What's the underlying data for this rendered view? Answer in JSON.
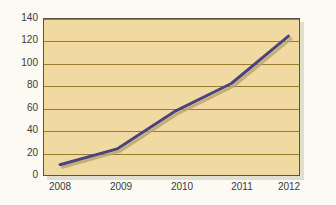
{
  "chart_data": {
    "type": "line",
    "title": "",
    "subtitle": "",
    "xlabel": "",
    "ylabel": "",
    "categories": [
      "2008",
      "2009",
      "2010",
      "2011",
      "2012"
    ],
    "x": [
      2008,
      2009,
      2010,
      2011,
      2012
    ],
    "series": [
      {
        "name": "",
        "values": [
          10,
          24,
          57,
          82,
          124
        ],
        "color": "#4a4480"
      }
    ],
    "values": [
      10,
      24,
      57,
      82,
      124
    ],
    "ylim": [
      0,
      140
    ],
    "yticks": [
      0,
      20,
      40,
      60,
      80,
      100,
      120,
      140
    ],
    "ytick_labels": [
      "0",
      "20",
      "40",
      "60",
      "80",
      "100",
      "120",
      "140"
    ],
    "xtick_labels": [
      "2008",
      "2009",
      "2010",
      "2011",
      "2012"
    ],
    "grid": true,
    "grid_axis": "y",
    "legend": false,
    "legend_position": "none",
    "annotations": [],
    "colors": {
      "plot_background": "#f1d9a2",
      "gridline": "#9b7c2c",
      "frame": "#5c5344",
      "line": "#4a4480",
      "line_shadow": "#bda472",
      "tick_text": "#3a3a3a",
      "page_background": "#fcfaf3"
    }
  }
}
